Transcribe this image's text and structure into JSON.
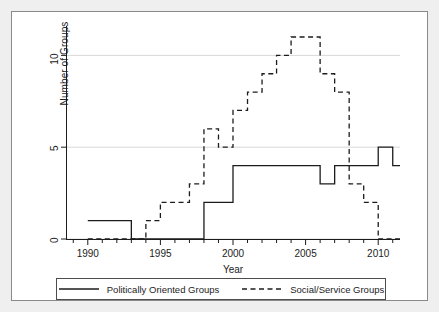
{
  "figure": {
    "background": "#efefef",
    "panel_background": "#ffffff",
    "frame_color": "#8a8a8a",
    "ink_color": "#1c1c1c",
    "grid_color": "#d8d8d8"
  },
  "axes": {
    "x_title": "Year",
    "y_title": "Number of Groups",
    "x_tick_labels": [
      "1990",
      "1995",
      "2000",
      "2005",
      "2010"
    ],
    "y_tick_labels": [
      "0",
      "5",
      "10"
    ]
  },
  "legend": {
    "entries": [
      {
        "label": "Politically Oriented Groups",
        "style": "solid",
        "icon": "solid-line-icon"
      },
      {
        "label": "Social/Service Groups",
        "style": "dashed",
        "icon": "dashed-line-icon"
      }
    ]
  },
  "chart_data": {
    "type": "line",
    "title": "",
    "subtitle": "",
    "xlabel": "Year",
    "ylabel": "Number of Groups",
    "xlim": [
      1988.5,
      2011.5
    ],
    "ylim": [
      0,
      11.6
    ],
    "xticks": [
      1990,
      1995,
      2000,
      2005,
      2010
    ],
    "yticks": [
      0,
      5,
      10
    ],
    "x_minor_tick_interval": 1,
    "grid": "horizontal-only",
    "legend_position": "bottom",
    "drawstyle": "steps-post",
    "x": [
      1990,
      1991,
      1992,
      1993,
      1994,
      1995,
      1996,
      1997,
      1998,
      1999,
      2000,
      2001,
      2002,
      2003,
      2004,
      2005,
      2006,
      2007,
      2008,
      2009,
      2010,
      2011
    ],
    "series": [
      {
        "name": "Politically Oriented Groups",
        "style": "solid",
        "color": "#1c1c1c",
        "values": [
          1,
          1,
          1,
          0,
          0,
          0,
          0,
          0,
          2,
          2,
          4,
          4,
          4,
          4,
          4,
          4,
          3,
          4,
          4,
          4,
          5,
          4
        ]
      },
      {
        "name": "Social/Service Groups",
        "style": "dashed",
        "color": "#1c1c1c",
        "values": [
          0,
          0,
          0,
          0,
          1,
          2,
          2,
          3,
          6,
          5,
          7,
          8,
          9,
          10,
          11,
          11,
          9,
          8,
          3,
          2,
          0,
          0
        ]
      }
    ]
  }
}
